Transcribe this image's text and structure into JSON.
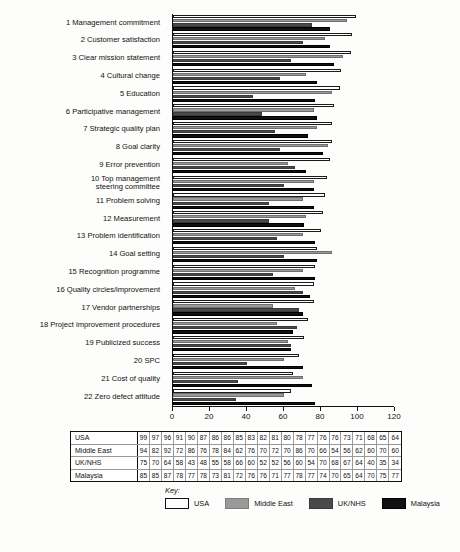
{
  "chart_data": {
    "type": "bar",
    "orientation": "horizontal",
    "title": "",
    "xlabel": "",
    "ylabel": "",
    "xlim": [
      0,
      120
    ],
    "xticks": [
      0,
      20,
      40,
      60,
      80,
      100,
      120
    ],
    "grid": false,
    "legend_position": "bottom",
    "legend_title": "Key:",
    "categories": [
      "1 Management commitment",
      "2 Customer satisfaction",
      "3 Clear mission statement",
      "4 Cultural change",
      "5 Education",
      "6 Participative management",
      "7 Strategic quality plan",
      "8 Goal clarity",
      "9 Error prevention",
      "10 Top management\nsteering committee",
      "11 Problem solving",
      "12 Measurement",
      "13 Problem identification",
      "14 Goal setting",
      "15 Recognition programme",
      "16 Quality circles/improvement",
      "17 Vendor partnerships",
      "18 Project improvement procedures",
      "19 Publicized success",
      "20 SPC",
      "21 Cost of quality",
      "22 Zero defect attitude"
    ],
    "series": [
      {
        "name": "USA",
        "color": "#ffffff",
        "values": [
          99,
          97,
          96,
          91,
          90,
          87,
          86,
          86,
          85,
          83,
          82,
          81,
          80,
          78,
          77,
          76,
          76,
          73,
          71,
          68,
          65,
          64
        ]
      },
      {
        "name": "Middle East",
        "color": "#9a9a9a",
        "values": [
          94,
          82,
          92,
          72,
          86,
          76,
          78,
          84,
          62,
          76,
          70,
          72,
          70,
          86,
          70,
          66,
          54,
          56,
          62,
          60,
          70,
          60
        ]
      },
      {
        "name": "UK/NHS",
        "color": "#4a4a4a",
        "values": [
          75,
          70,
          64,
          58,
          43,
          48,
          55,
          58,
          66,
          60,
          52,
          52,
          56,
          60,
          54,
          70,
          68,
          67,
          64,
          40,
          35,
          34
        ]
      },
      {
        "name": "Malaysia",
        "color": "#111111",
        "values": [
          85,
          85,
          87,
          78,
          77,
          78,
          73,
          81,
          72,
          76,
          76,
          71,
          77,
          78,
          77,
          74,
          70,
          65,
          64,
          70,
          75,
          77
        ]
      }
    ]
  },
  "table": {
    "row_headers": [
      "USA",
      "Middle East",
      "UK/NHS",
      "Malaysia"
    ]
  },
  "legend": {
    "title": "Key:",
    "items": [
      {
        "label": "USA"
      },
      {
        "label": "Middle East"
      },
      {
        "label": "UK/NHS"
      },
      {
        "label": "Malaysia"
      }
    ]
  }
}
